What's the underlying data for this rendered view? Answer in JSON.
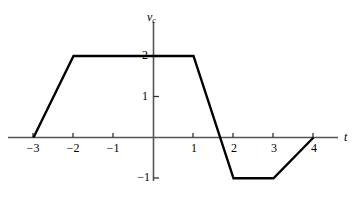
{
  "figure": {
    "background_color": "#ffffff",
    "curve_color": "#000000",
    "axis_color": "#555555",
    "curve_width": 2.4,
    "axis_width": 1.4
  },
  "axes": {
    "x": {
      "label": "t",
      "label_name": "t",
      "ticks": [
        {
          "value": -3,
          "label": "−3"
        },
        {
          "value": -2,
          "label": "−2"
        },
        {
          "value": -1,
          "label": "−1"
        },
        {
          "value": 1,
          "label": "1"
        },
        {
          "value": 2,
          "label": "2"
        },
        {
          "value": 3,
          "label": "3"
        },
        {
          "value": 4,
          "label": "4"
        }
      ],
      "range": [
        -3.5,
        4.6
      ]
    },
    "y": {
      "label_main": "v",
      "label_sub": "c",
      "ticks": [
        {
          "value": 2,
          "label": "2"
        },
        {
          "value": 1,
          "label": "1"
        },
        {
          "value": -1,
          "label": "−1"
        }
      ],
      "range": [
        -1.45,
        2.65
      ]
    }
  },
  "chart_data": {
    "type": "line",
    "title": "",
    "xlabel": "t",
    "ylabel": "v_c",
    "xlim": [
      -3.5,
      4.6
    ],
    "ylim": [
      -1.45,
      2.65
    ],
    "grid": false,
    "legend": "none",
    "series": [
      {
        "name": "v_c(t)",
        "x": [
          -3,
          -2,
          1,
          2,
          3,
          4
        ],
        "y": [
          0,
          2,
          2,
          -1,
          -1,
          0
        ]
      }
    ],
    "annotations": [],
    "x_tick_labels": [
      "−3",
      "−2",
      "−1",
      "1",
      "2",
      "3",
      "4"
    ],
    "x_tick_values": [
      -3,
      -2,
      -1,
      1,
      2,
      3,
      4
    ],
    "y_tick_labels": [
      "2",
      "1",
      "−1"
    ],
    "y_tick_values": [
      2,
      1,
      -1
    ]
  }
}
